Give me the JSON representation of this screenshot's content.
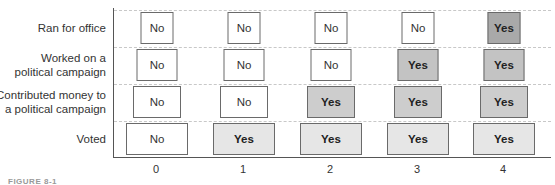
{
  "chart_data": {
    "type": "table",
    "title": "",
    "xlabel": "",
    "ylabel": "",
    "categories": [
      "0",
      "1",
      "2",
      "3",
      "4"
    ],
    "rows": [
      {
        "label": "Ran for office",
        "values": [
          "No",
          "No",
          "No",
          "No",
          "Yes"
        ],
        "yes_color": "#a9a9a9"
      },
      {
        "label": "Worked on a political campaign",
        "label_lines": [
          "Worked on a",
          "political campaign"
        ],
        "values": [
          "No",
          "No",
          "No",
          "Yes",
          "Yes"
        ],
        "yes_color": "#c3c3c3"
      },
      {
        "label": "Contributed money to a political campaign",
        "label_lines": [
          "Contributed money to",
          "a political campaign"
        ],
        "values": [
          "No",
          "No",
          "Yes",
          "Yes",
          "Yes"
        ],
        "yes_color": "#cdcdcd"
      },
      {
        "label": "Voted",
        "values": [
          "No",
          "Yes",
          "Yes",
          "Yes",
          "Yes"
        ],
        "yes_color": "#e6e6e6"
      }
    ],
    "grid": "dashed horizontal",
    "caption": "FIGURE 8-1"
  },
  "labels": {
    "row0": "Ran for office",
    "row1a": "Worked on a",
    "row1b": "political campaign",
    "row2a": "Contributed money to",
    "row2b": "a political campaign",
    "row3": "Voted"
  },
  "ticks": [
    "0",
    "1",
    "2",
    "3",
    "4"
  ],
  "caption": "FIGURE 8-1"
}
